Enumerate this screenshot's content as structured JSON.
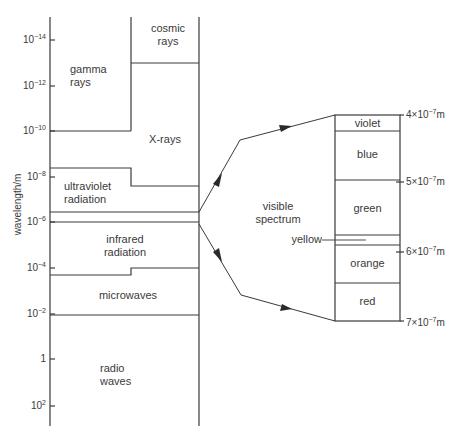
{
  "diagram": {
    "y_axis_label": "wavelength/m",
    "y_ticks": [
      {
        "base": "10",
        "exp": "−14"
      },
      {
        "base": "10",
        "exp": "−12"
      },
      {
        "base": "10",
        "exp": "−10"
      },
      {
        "base": "10",
        "exp": "−8"
      },
      {
        "base": "10",
        "exp": "−6"
      },
      {
        "base": "10",
        "exp": "−4"
      },
      {
        "base": "10",
        "exp": "−2"
      },
      {
        "base": "1",
        "exp": ""
      },
      {
        "base": "10",
        "exp": "2"
      }
    ],
    "regions": {
      "cosmic": [
        "cosmic",
        "rays"
      ],
      "gamma": [
        "gamma",
        "rays"
      ],
      "xrays": [
        "X-rays"
      ],
      "uv": [
        "ultraviolet",
        "radiation"
      ],
      "ir": [
        "infrared",
        "radiation"
      ],
      "micro": [
        "microwaves"
      ],
      "radio": [
        "radio",
        "waves"
      ]
    },
    "visible_label": [
      "visible",
      "spectrum"
    ],
    "colors": {
      "violet": "violet",
      "blue": "blue",
      "green": "green",
      "yellow": "yellow",
      "orange": "orange",
      "red": "red"
    },
    "visible_wavelengths": [
      {
        "coef": "4×10",
        "exp": "−7",
        "unit": "m"
      },
      {
        "coef": "5×10",
        "exp": "−7",
        "unit": "m"
      },
      {
        "coef": "6×10",
        "exp": "−7",
        "unit": "m"
      },
      {
        "coef": "7×10",
        "exp": "−7",
        "unit": "m"
      }
    ],
    "line_color": "#3a3a3a"
  }
}
